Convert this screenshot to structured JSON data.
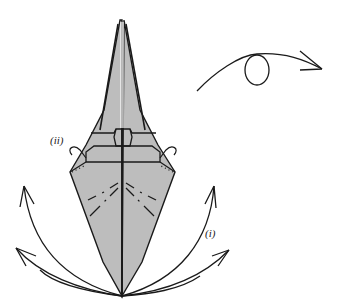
{
  "diagram": {
    "labels": {
      "step_ii": "(ii)",
      "step_i": "(i)"
    },
    "colors": {
      "paper": "#bdbdbd",
      "ink": "#1a1a1a",
      "background": "#ffffff"
    },
    "icons": {
      "turn_over": "turn-over-loop-arrow-icon",
      "fold_out": "curved-arrow-icon"
    }
  }
}
